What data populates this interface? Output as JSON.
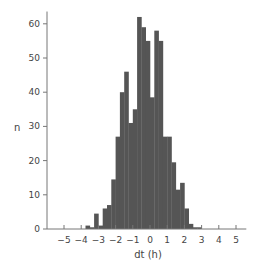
{
  "chart_data": {
    "type": "bar",
    "title": "",
    "xlabel": "dt (h)",
    "ylabel": "n",
    "xlim": [
      -5.5,
      5.5
    ],
    "ylim": [
      0,
      63
    ],
    "x_ticks": [
      -5,
      -4,
      -3,
      -2,
      -1,
      0,
      1,
      2,
      3,
      4,
      5
    ],
    "y_ticks": [
      0,
      10,
      20,
      30,
      40,
      50,
      60
    ],
    "grid": false,
    "bin_width": 0.25,
    "bar_color": "#555555",
    "bins_left_edge": [
      -3.75,
      -3.5,
      -3.25,
      -3.0,
      -2.75,
      -2.5,
      -2.25,
      -2.0,
      -1.75,
      -1.5,
      -1.25,
      -1.0,
      -0.75,
      -0.5,
      -0.25,
      0.0,
      0.25,
      0.5,
      0.75,
      1.0,
      1.25,
      1.5,
      1.75,
      2.0,
      2.25,
      2.5,
      2.75
    ],
    "values": [
      1,
      0.5,
      4.5,
      1,
      6,
      7,
      14.5,
      27,
      40,
      46,
      31,
      35,
      62,
      59,
      55,
      38.5,
      58,
      55,
      27,
      27,
      19.5,
      11.5,
      13.5,
      6,
      1.5,
      0.5,
      0.5
    ]
  }
}
